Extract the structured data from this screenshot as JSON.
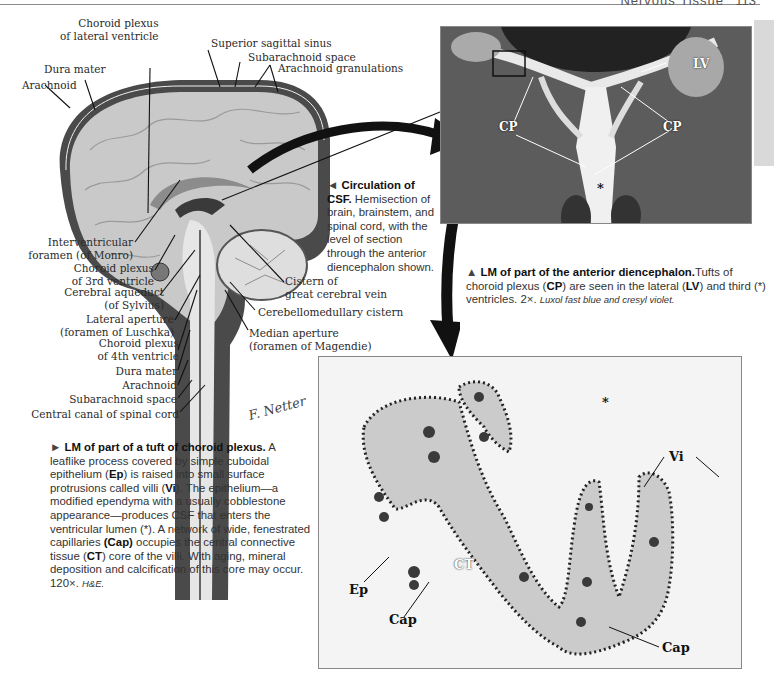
{
  "header": {
    "section_title": "Nervous Tissue",
    "page_number": "113"
  },
  "brain_diagram": {
    "title_labels_top": [
      {
        "id": "choroid-lateral",
        "text": "Choroid plexus\nof lateral ventricle"
      },
      {
        "id": "superior-sagittal-sinus",
        "text": "Superior sagittal sinus"
      },
      {
        "id": "subarachnoid-space-top",
        "text": "Subarachnoid space"
      },
      {
        "id": "arachnoid-granulations",
        "text": "Arachnoid granulations"
      },
      {
        "id": "dura-mater-top",
        "text": "Dura mater"
      },
      {
        "id": "arachnoid-top",
        "text": "Arachnoid"
      }
    ],
    "left_labels": [
      {
        "id": "interventricular-foramen",
        "line1": "Interventricular",
        "line2": "foramen (of Monro)"
      },
      {
        "id": "choroid-3rd",
        "line1": "Choroid plexus",
        "line2": "of 3rd ventricle"
      },
      {
        "id": "cerebral-aqueduct",
        "line1": "Cerebral aqueduct",
        "line2": "(of Sylvius)"
      },
      {
        "id": "lateral-aperture",
        "line1": "Lateral aperture",
        "line2": "(foramen of Luschka)"
      },
      {
        "id": "choroid-4th",
        "line1": "Choroid plexus",
        "line2": "of 4th ventricle"
      },
      {
        "id": "dura-mater-bottom",
        "line1": "Dura mater",
        "line2": ""
      },
      {
        "id": "arachnoid-bottom",
        "line1": "Arachnoid",
        "line2": ""
      },
      {
        "id": "subarachnoid-space-bottom",
        "line1": "Subarachnoid space",
        "line2": ""
      },
      {
        "id": "central-canal",
        "line1": "Central canal of spinal cord",
        "line2": ""
      }
    ],
    "right_labels": [
      {
        "id": "cistern-great-cerebral-vein",
        "line1": "Cistern of",
        "line2": "great cerebral vein"
      },
      {
        "id": "cerebellomedullary-cistern",
        "line1": "Cerebellomedullary cistern",
        "line2": ""
      },
      {
        "id": "median-aperture",
        "line1": "Median aperture",
        "line2": "(foramen of Magendie)"
      }
    ],
    "signature": "F. Netter M.D."
  },
  "captions": {
    "circulation": {
      "marker": "◄",
      "title": "Circulation of CSF.",
      "body": " Hemisection of brain, brainstem, and spinal cord, with the level of section through the anterior diencephalon shown."
    },
    "diencephalon": {
      "marker": "▲",
      "title": "LM of part of the anterior diencephalon.",
      "body_1": "Tufts of choroid plexus (",
      "cp": "CP",
      "body_2": ") are seen in the lateral (",
      "lv": "LV",
      "body_3": ") and third (*) ventricles. 2×. ",
      "stain": "Luxol fast blue and cresyl violet."
    },
    "choroid_tuft": {
      "marker": "►",
      "title": "LM of part of a tuft of choroid plexus.",
      "body_1": " A leaflike process covered by simple cuboidal epithelium (",
      "ep": "Ep",
      "body_2": ") is raised into small surface protrusions called villi (",
      "vi": "Vi",
      "body_3": "). The epithelium—a modified ependyma with a usually cobblestone appearance—produces CSF that enters the ventricular lumen (*). A network of wide, fenestrated capillaries ",
      "cap": "(Cap)",
      "body_4": " occupies the central connective tissue (",
      "ct": "CT",
      "body_5": ") core of the villi. With aging, mineral deposition and calcification of this core may occur. 120×. ",
      "stain": "H&E."
    }
  },
  "micrograph_top": {
    "labels": {
      "lv": "LV",
      "cp_left": "CP",
      "cp_right": "CP",
      "star": "*"
    }
  },
  "micrograph_bottom": {
    "labels": {
      "vi": "Vi",
      "ct": "CT",
      "ep": "Ep",
      "cap_left": "Cap",
      "cap_right": "Cap",
      "star": "*"
    }
  },
  "colors": {
    "diagram_gray": "#bdbdbd",
    "dark_gray": "#555555",
    "tissue": "#cfcfcf",
    "nuclei": "#2b2b2b"
  }
}
